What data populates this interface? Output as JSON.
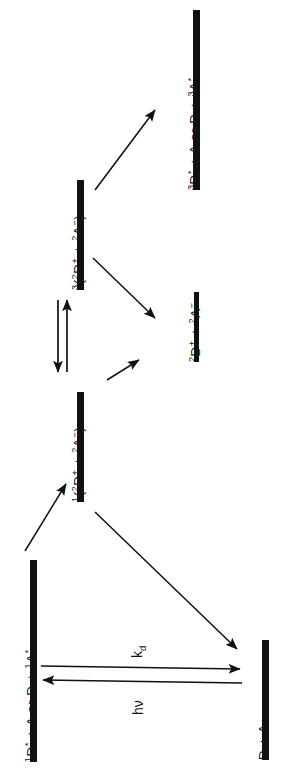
{
  "figure": {
    "type": "energy-level-diagram",
    "orientation": "rotated-90-ccw",
    "background_color": "#ffffff",
    "ink_color": "#111111"
  },
  "levels": [
    {
      "id": "singlet-excited",
      "label_html": "<sup>1</sup>D<sup>*</sup> + A or D + <sup>1</sup>A<sup>*</sup>",
      "label_text": "1D* + A or D + 1A*",
      "bar_x": 33,
      "bar_y": 560,
      "bar_h": 202,
      "bar_w": 7
    },
    {
      "id": "singlet-ion-pair",
      "label_html": "<sup>1</sup>(<sup>2</sup>D<sup>+</sup> + <sup>2</sup>A<sup>&#8722;</sup>)",
      "label_text": "1(2D+ + 2A-)",
      "bar_x": 80,
      "bar_y": 392,
      "bar_h": 110,
      "bar_w": 7
    },
    {
      "id": "triplet-ion-pair",
      "label_html": "<sup>3</sup>(<sup>2</sup>D<sup>+</sup> + <sup>2</sup>A<sup>&#8722;</sup>)",
      "label_text": "3(2D+ + 2A-)",
      "bar_x": 80,
      "bar_y": 180,
      "bar_h": 110,
      "bar_w": 7
    },
    {
      "id": "triplet-excited",
      "label_html": "<sup>3</sup>D<sup>*</sup> + A or D + <sup>3</sup>A<sup>*</sup>",
      "label_text": "3D* + A or D + 3A*",
      "bar_x": 196,
      "bar_y": 10,
      "bar_h": 180,
      "bar_w": 7
    },
    {
      "id": "free-ions",
      "label_html": "<sup>2</sup>D<sup>+</sup> + <sup>2</sup>A<sup>&#8722;</sup>",
      "label_text": "2D+ + 2A-",
      "bar_x": 196,
      "bar_y": 292,
      "bar_h": 70,
      "bar_w": 5
    },
    {
      "id": "ground-state",
      "label_html": "D + A",
      "label_text": "D + A",
      "bar_x": 265,
      "bar_y": 640,
      "bar_h": 120,
      "bar_w": 7
    }
  ],
  "rate_labels": [
    {
      "id": "kd",
      "html": "k<sub>d</sub>",
      "text": "kd"
    },
    {
      "id": "hnu",
      "html": "h&#957;",
      "text": "hν"
    }
  ],
  "transitions": [
    {
      "id": "excite-to-singlet-pair",
      "from": "singlet-excited",
      "to": "singlet-ion-pair",
      "style": "single-arrow"
    },
    {
      "id": "singlet-pair-to-triplet-pair",
      "from": "singlet-ion-pair",
      "to": "triplet-ion-pair",
      "style": "double-arrow-equilibrium"
    },
    {
      "id": "singlet-pair-to-free-ions",
      "from": "singlet-ion-pair",
      "to": "free-ions",
      "style": "single-arrow"
    },
    {
      "id": "triplet-pair-to-free-ions",
      "from": "triplet-ion-pair",
      "to": "free-ions",
      "style": "single-arrow"
    },
    {
      "id": "triplet-pair-to-triplet-excited",
      "from": "triplet-ion-pair",
      "to": "triplet-excited",
      "style": "single-arrow"
    },
    {
      "id": "singlet-pair-to-ground",
      "from": "singlet-ion-pair",
      "to": "ground-state",
      "style": "single-arrow"
    },
    {
      "id": "ground-to-excited-absorption",
      "from": "ground-state",
      "to": "singlet-excited",
      "style": "single-arrow",
      "label": "hnu"
    },
    {
      "id": "excited-to-ground-decay",
      "from": "singlet-excited",
      "to": "ground-state",
      "style": "single-arrow",
      "label": "kd"
    }
  ]
}
